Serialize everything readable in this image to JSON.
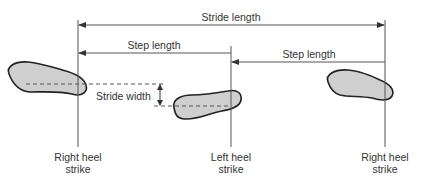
{
  "diagram": {
    "labels": {
      "stride_length": "Stride length",
      "step_length_left": "Step length",
      "step_length_right": "Step length",
      "stride_width": "Stride width"
    },
    "events": [
      {
        "line1": "Right heel",
        "line2": "strike"
      },
      {
        "line1": "Left heel",
        "line2": "strike"
      },
      {
        "line1": "Right heel",
        "line2": "strike"
      }
    ],
    "footprints": [
      {
        "name": "right-footprint-1",
        "foot": "right"
      },
      {
        "name": "left-footprint",
        "foot": "left"
      },
      {
        "name": "right-footprint-2",
        "foot": "right"
      }
    ],
    "colors": {
      "line": "#555555",
      "footprint_fill": "#cfcfcf",
      "footprint_stroke": "#222222",
      "text": "#333333"
    }
  }
}
